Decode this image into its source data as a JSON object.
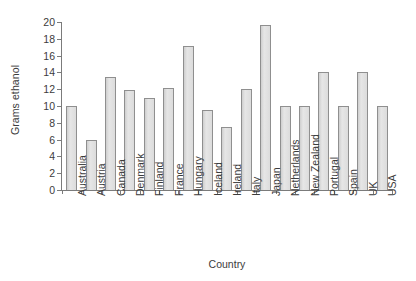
{
  "chart_data": {
    "type": "bar",
    "title": "",
    "xlabel": "Country",
    "ylabel": "Grams ethanol",
    "ylim": [
      0,
      20
    ],
    "yticks": [
      0,
      2,
      4,
      6,
      8,
      10,
      12,
      14,
      16,
      18,
      20
    ],
    "grid": false,
    "legend": null,
    "categories": [
      "Australia",
      "Austria",
      "Canada",
      "Denmark",
      "Finland",
      "France",
      "Hungary",
      "Iceland",
      "Ireland",
      "Italy",
      "Japan",
      "Netherlands",
      "New Zealand",
      "Portugal",
      "Spain",
      "UK",
      "USA"
    ],
    "values": [
      10.0,
      6.0,
      13.5,
      11.9,
      11.0,
      12.1,
      17.2,
      9.5,
      7.5,
      12.0,
      19.6,
      10.0,
      10.0,
      14.1,
      10.0,
      14.1,
      10.0
    ],
    "bar_color": "#dcdcdc",
    "bar_border_color": "#8f8f8f",
    "axis_color": "#7b7b7b",
    "text_color": "#3c3c3c"
  }
}
